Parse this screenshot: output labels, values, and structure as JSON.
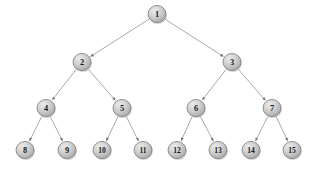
{
  "diagram": {
    "type": "tree",
    "background_color": "#ffffff",
    "node_fill_light": "#e2e2e2",
    "node_fill_mid": "#c9c9c9",
    "node_fill_dark": "#a8a8a8",
    "node_border_color": "#7c7c7c",
    "edge_color": "#9a9a9a",
    "arrow_color": "#6f6f6f",
    "label_color": "#1a1a1a",
    "width": 309,
    "height": 171
  },
  "nodes": [
    {
      "id": "n1",
      "label": "1",
      "cx": 157,
      "cy": 14,
      "r": 9.0,
      "level": 0
    },
    {
      "id": "n2",
      "label": "2",
      "cx": 82,
      "cy": 62,
      "r": 9.0,
      "level": 1
    },
    {
      "id": "n3",
      "label": "3",
      "cx": 232,
      "cy": 62,
      "r": 9.0,
      "level": 1
    },
    {
      "id": "n4",
      "label": "4",
      "cx": 46,
      "cy": 108,
      "r": 9.0,
      "level": 2
    },
    {
      "id": "n5",
      "label": "5",
      "cx": 122,
      "cy": 108,
      "r": 9.0,
      "level": 2
    },
    {
      "id": "n6",
      "label": "6",
      "cx": 196,
      "cy": 108,
      "r": 9.0,
      "level": 2
    },
    {
      "id": "n7",
      "label": "7",
      "cx": 272,
      "cy": 108,
      "r": 9.0,
      "level": 2
    },
    {
      "id": "n8",
      "label": "8",
      "cx": 25,
      "cy": 150,
      "r": 9.0,
      "level": 3
    },
    {
      "id": "n9",
      "label": "9",
      "cx": 67,
      "cy": 150,
      "r": 9.0,
      "level": 3
    },
    {
      "id": "n10",
      "label": "10",
      "cx": 102,
      "cy": 150,
      "r": 9.0,
      "level": 3
    },
    {
      "id": "n11",
      "label": "11",
      "cx": 143,
      "cy": 150,
      "r": 9.0,
      "level": 3
    },
    {
      "id": "n12",
      "label": "12",
      "cx": 177,
      "cy": 150,
      "r": 9.0,
      "level": 3
    },
    {
      "id": "n13",
      "label": "13",
      "cx": 218,
      "cy": 150,
      "r": 9.0,
      "level": 3
    },
    {
      "id": "n14",
      "label": "14",
      "cx": 251,
      "cy": 150,
      "r": 9.0,
      "level": 3
    },
    {
      "id": "n15",
      "label": "15",
      "cx": 292,
      "cy": 150,
      "r": 9.0,
      "level": 3
    }
  ],
  "edges": [
    {
      "id": "e1-2",
      "from": "n1",
      "to": "n2",
      "directed": true
    },
    {
      "id": "e1-3",
      "from": "n1",
      "to": "n3",
      "directed": true
    },
    {
      "id": "e2-4",
      "from": "n2",
      "to": "n4",
      "directed": true
    },
    {
      "id": "e2-5",
      "from": "n2",
      "to": "n5",
      "directed": true
    },
    {
      "id": "e3-6",
      "from": "n3",
      "to": "n6",
      "directed": true
    },
    {
      "id": "e3-7",
      "from": "n3",
      "to": "n7",
      "directed": true
    },
    {
      "id": "e4-8",
      "from": "n4",
      "to": "n8",
      "directed": true
    },
    {
      "id": "e4-9",
      "from": "n4",
      "to": "n9",
      "directed": true
    },
    {
      "id": "e5-10",
      "from": "n5",
      "to": "n10",
      "directed": true
    },
    {
      "id": "e5-11",
      "from": "n5",
      "to": "n11",
      "directed": true
    },
    {
      "id": "e6-12",
      "from": "n6",
      "to": "n12",
      "directed": true
    },
    {
      "id": "e6-13",
      "from": "n6",
      "to": "n13",
      "directed": true
    },
    {
      "id": "e7-14",
      "from": "n7",
      "to": "n14",
      "directed": true
    },
    {
      "id": "e7-15",
      "from": "n7",
      "to": "n15",
      "directed": true
    }
  ]
}
